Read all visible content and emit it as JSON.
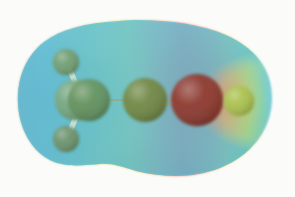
{
  "figure": {
    "kind": "molecular-electrostatic-potential-surface",
    "background_color": "#fbfbf9",
    "canvas": {
      "width": 295,
      "height": 197
    }
  },
  "surface": {
    "name": "electron-density-isosurface",
    "outline_bounds": {
      "x_min": 18,
      "x_max": 273,
      "y_min": 21,
      "y_max": 177
    },
    "opacity": 0.93,
    "notch_top_x": 118,
    "notch_bottom_x": 122,
    "potential_scale": {
      "legend": "red = most negative potential, blue = most positive potential",
      "stops": [
        {
          "offset": 0.0,
          "color": "#9fb4a6",
          "label": "neutral-grey-green"
        },
        {
          "offset": 0.1,
          "color": "#8fc4b4",
          "label": "teal"
        },
        {
          "offset": 0.22,
          "color": "#9fd18a",
          "label": "green"
        },
        {
          "offset": 0.34,
          "color": "#bfe06a",
          "label": "yellow-green"
        },
        {
          "offset": 0.44,
          "color": "#d9e05e",
          "label": "yellow"
        },
        {
          "offset": 0.55,
          "color": "#f0a765",
          "label": "orange"
        },
        {
          "offset": 0.65,
          "color": "#f2705c",
          "label": "red"
        },
        {
          "offset": 0.74,
          "color": "#f0975e",
          "label": "orange-2"
        },
        {
          "offset": 0.82,
          "color": "#e8d257",
          "label": "yellow-2"
        },
        {
          "offset": 0.9,
          "color": "#b9df62",
          "label": "yellow-green-2"
        },
        {
          "offset": 0.97,
          "color": "#7fd0b0",
          "label": "cyan-green"
        },
        {
          "offset": 1.0,
          "color": "#6fc8e0",
          "label": "blue-cyan"
        }
      ]
    }
  },
  "molecule": {
    "name": "propyne",
    "atoms": [
      {
        "id": "H1",
        "element": "H",
        "label": "hydrogen",
        "cx": 66,
        "cy": 62,
        "r": 13,
        "color": "#6f9a6a"
      },
      {
        "id": "H2",
        "element": "H",
        "label": "hydrogen",
        "cx": 66,
        "cy": 139,
        "r": 13,
        "color": "#6b8f63"
      },
      {
        "id": "C1a",
        "element": "C",
        "label": "carbon",
        "cx": 75,
        "cy": 100,
        "r": 20,
        "color": "#74a578"
      },
      {
        "id": "C1b",
        "element": "C",
        "label": "carbon",
        "cx": 89,
        "cy": 100,
        "r": 21,
        "color": "#5f8e58"
      },
      {
        "id": "C2",
        "element": "C",
        "label": "carbon",
        "cx": 145,
        "cy": 100,
        "r": 22,
        "color": "#6d8239"
      },
      {
        "id": "C3",
        "element": "C",
        "label": "carbon",
        "cx": 197,
        "cy": 100,
        "r": 26,
        "color": "#8a2f22"
      },
      {
        "id": "H3",
        "element": "H",
        "label": "hydrogen",
        "cx": 239,
        "cy": 101,
        "r": 15,
        "color": "#a8c149"
      }
    ],
    "bonds": [
      {
        "id": "b-h1",
        "name": "bond-h1-c1",
        "x1": 70,
        "y1": 70,
        "x2": 79,
        "y2": 92,
        "width": 5.5,
        "order": 1,
        "color": "#d9e6d2"
      },
      {
        "id": "b-h2",
        "name": "bond-h2-c1",
        "x1": 70,
        "y1": 131,
        "x2": 79,
        "y2": 110,
        "width": 5.5,
        "order": 1,
        "color": "#d9e6d2"
      },
      {
        "id": "b-c1c2",
        "name": "bond-c1-c2",
        "x1": 95,
        "y1": 100,
        "x2": 140,
        "y2": 100,
        "width": 2.2,
        "order": 1,
        "color": "#94a87e"
      },
      {
        "id": "b-c2c3",
        "name": "bond-c2-c3-triple",
        "x1": 160,
        "y1": 100,
        "x2": 190,
        "y2": 100,
        "width": 2.0,
        "order": 3,
        "color": "#b2a07c"
      },
      {
        "id": "b-c3h3",
        "name": "bond-c3-h3",
        "x1": 215,
        "y1": 100,
        "x2": 233,
        "y2": 101,
        "width": 2.4,
        "order": 1,
        "color": "#c0ab6c"
      }
    ]
  }
}
